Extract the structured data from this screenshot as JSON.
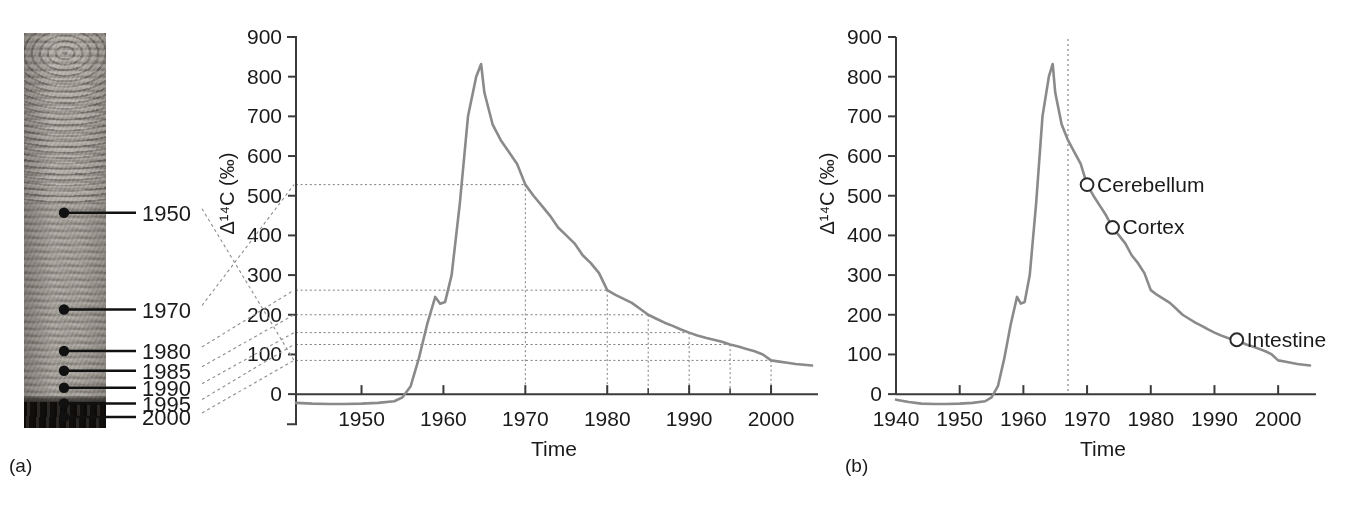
{
  "figure": {
    "panels": [
      {
        "id": "a",
        "letter": "(a)"
      },
      {
        "id": "b",
        "letter": "(b)"
      }
    ]
  },
  "tree_ring": {
    "name": "tree-ring-cross-section",
    "markers": [
      {
        "label": "1950",
        "y_frac": 0.455
      },
      {
        "label": "1970",
        "y_frac": 0.7
      },
      {
        "label": "1980",
        "y_frac": 0.805
      },
      {
        "label": "1985",
        "y_frac": 0.855
      },
      {
        "label": "1990",
        "y_frac": 0.898
      },
      {
        "label": "1995",
        "y_frac": 0.938
      },
      {
        "label": "2000",
        "y_frac": 0.972
      }
    ]
  },
  "chart_data": [
    {
      "id": "panel-a",
      "type": "line",
      "title": "",
      "xlabel": "Time",
      "ylabel": "Δ¹⁴C (‰)",
      "xlim": [
        1942,
        2005
      ],
      "ylim": [
        -40,
        900
      ],
      "xticks": [
        1950,
        1960,
        1970,
        1980,
        1990,
        2000
      ],
      "xticklabels": [
        "1950",
        "1960",
        "1970",
        "1980",
        "1990",
        "2000"
      ],
      "yticks": [
        0,
        100,
        200,
        300,
        400,
        500,
        600,
        700,
        800,
        900
      ],
      "yticklabels": [
        "0",
        "100",
        "200",
        "300",
        "400",
        "500",
        "600",
        "700",
        "800",
        "900"
      ],
      "minor_xticks": [
        1985,
        1995
      ],
      "grid": false,
      "legend": "none",
      "series": [
        {
          "name": "Atmospheric Δ14C bomb curve",
          "color": "#8a8a8a",
          "x": [
            1942,
            1944,
            1946,
            1948,
            1950,
            1952,
            1954,
            1955,
            1956,
            1957,
            1958,
            1959,
            1959.6,
            1960.2,
            1961,
            1962,
            1963,
            1964,
            1964.6,
            1965,
            1966,
            1967,
            1968,
            1969,
            1970,
            1971,
            1972,
            1973,
            1974,
            1975,
            1976,
            1977,
            1978,
            1979,
            1980,
            1981,
            1982,
            1983,
            1984,
            1985,
            1986,
            1987,
            1988,
            1989,
            1990,
            1991,
            1992,
            1993,
            1994,
            1995,
            1996,
            1997,
            1998,
            1999,
            2000,
            2001,
            2002,
            2003,
            2004,
            2005
          ],
          "y": [
            -22,
            -24,
            -25,
            -25,
            -24,
            -22,
            -18,
            -8,
            20,
            90,
            175,
            245,
            228,
            232,
            300,
            480,
            700,
            800,
            832,
            760,
            680,
            640,
            610,
            580,
            528,
            500,
            475,
            450,
            420,
            400,
            380,
            350,
            330,
            305,
            262,
            250,
            240,
            230,
            215,
            200,
            190,
            180,
            172,
            163,
            155,
            148,
            142,
            137,
            132,
            125,
            120,
            114,
            108,
            100,
            85,
            82,
            79,
            76,
            74,
            72
          ]
        }
      ],
      "leader_lines": [
        {
          "label": "1950",
          "year": 2000,
          "value": 85
        },
        {
          "label": "1970",
          "year": 1970,
          "value": 528
        },
        {
          "label": "1980",
          "year": 1980,
          "value": 262
        },
        {
          "label": "1985",
          "year": 1985,
          "value": 200
        },
        {
          "label": "1990",
          "year": 1990,
          "value": 155
        },
        {
          "label": "1995",
          "year": 1995,
          "value": 125
        },
        {
          "label": "2000",
          "year": 2000,
          "value": 85
        }
      ],
      "guide_values": [
        528,
        262,
        200,
        155,
        125,
        85
      ],
      "guide_years": [
        1970,
        1980,
        1985,
        1990,
        1995,
        2000
      ]
    },
    {
      "id": "panel-b",
      "type": "line",
      "title": "",
      "xlabel": "Time",
      "ylabel": "Δ¹⁴C (‰)",
      "xlim": [
        1940,
        2005
      ],
      "ylim": [
        -40,
        900
      ],
      "xticks": [
        1940,
        1950,
        1960,
        1970,
        1980,
        1990,
        2000
      ],
      "xticklabels": [
        "1940",
        "1950",
        "1960",
        "1970",
        "1980",
        "1990",
        "2000"
      ],
      "yticks": [
        0,
        100,
        200,
        300,
        400,
        500,
        600,
        700,
        800,
        900
      ],
      "yticklabels": [
        "0",
        "100",
        "200",
        "300",
        "400",
        "500",
        "600",
        "700",
        "800",
        "900"
      ],
      "grid": false,
      "legend": "none",
      "birth_year_line": 1967,
      "series": [
        {
          "name": "Atmospheric Δ14C bomb curve",
          "color": "#8a8a8a",
          "x": [
            1940,
            1942,
            1944,
            1946,
            1948,
            1950,
            1952,
            1954,
            1955,
            1956,
            1957,
            1958,
            1959,
            1959.6,
            1960.2,
            1961,
            1962,
            1963,
            1964,
            1964.6,
            1965,
            1966,
            1967,
            1968,
            1969,
            1970,
            1971,
            1972,
            1973,
            1974,
            1975,
            1976,
            1977,
            1978,
            1979,
            1980,
            1981,
            1982,
            1983,
            1984,
            1985,
            1986,
            1987,
            1988,
            1989,
            1990,
            1991,
            1992,
            1993,
            1994,
            1995,
            1996,
            1997,
            1998,
            1999,
            2000,
            2001,
            2002,
            2003,
            2004,
            2005
          ],
          "y": [
            -14,
            -20,
            -24,
            -25,
            -25,
            -24,
            -22,
            -18,
            -8,
            20,
            90,
            175,
            245,
            228,
            232,
            300,
            480,
            700,
            800,
            832,
            760,
            680,
            640,
            610,
            580,
            528,
            500,
            475,
            450,
            420,
            400,
            380,
            350,
            330,
            305,
            262,
            250,
            240,
            230,
            215,
            200,
            190,
            180,
            172,
            163,
            155,
            148,
            142,
            137,
            132,
            125,
            120,
            114,
            108,
            100,
            85,
            82,
            79,
            76,
            74,
            72
          ]
        }
      ],
      "annotations": [
        {
          "label": "Cerebellum",
          "year": 1970,
          "value": 528
        },
        {
          "label": "Cortex",
          "year": 1974,
          "value": 420
        },
        {
          "label": "Intestine",
          "year": 1993.5,
          "value": 137
        }
      ]
    }
  ],
  "colors": {
    "curve": "#8a8a8a",
    "axis": "#3a3a3a",
    "grid_dotted": "#7d7d7d",
    "leader": "#8d8d8d",
    "text": "#1a1a1a",
    "marker_fill": "#ffffff",
    "marker_stroke": "#2b2b2b"
  }
}
